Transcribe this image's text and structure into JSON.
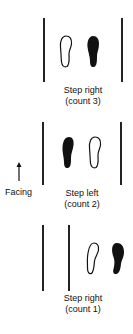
{
  "panels": [
    {
      "id": "step-right-count-3",
      "caption_line1": "Step right",
      "caption_line2": "(count 3)",
      "feet": [
        {
          "side": "left",
          "style": "outline"
        },
        {
          "side": "right",
          "style": "filled"
        }
      ]
    },
    {
      "id": "step-left-count-2",
      "caption_line1": "Step left",
      "caption_line2": "(count 2)",
      "feet": [
        {
          "side": "left",
          "style": "filled"
        },
        {
          "side": "right",
          "style": "outline"
        }
      ]
    },
    {
      "id": "step-right-count-1",
      "caption_line1": "Step right",
      "caption_line2": "(count 1)",
      "feet": [
        {
          "side": "left",
          "style": "outline"
        },
        {
          "side": "right",
          "style": "filled"
        }
      ]
    }
  ],
  "facing": {
    "label": "Facing",
    "icon": "up-arrow-icon"
  },
  "colors": {
    "ink": "#111111",
    "background": "#ffffff"
  }
}
